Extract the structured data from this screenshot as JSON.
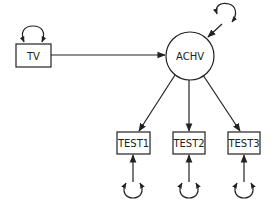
{
  "diagram": {
    "type": "path-diagram",
    "colors": {
      "stroke": "#222222",
      "background": "#ffffff"
    },
    "nodes": {
      "tv": {
        "label": "TV",
        "shape": "rectangle"
      },
      "achv": {
        "label": "ACHV",
        "shape": "circle"
      },
      "test1": {
        "label": "TEST1",
        "shape": "rectangle"
      },
      "test2": {
        "label": "TEST2",
        "shape": "rectangle"
      },
      "test3": {
        "label": "TEST3",
        "shape": "rectangle"
      }
    },
    "edges": [
      {
        "from": "TV",
        "to": "ACHV"
      },
      {
        "from": "ACHV",
        "to": "TEST1"
      },
      {
        "from": "ACHV",
        "to": "TEST2"
      },
      {
        "from": "ACHV",
        "to": "TEST3"
      },
      {
        "from": "disturbance",
        "to": "ACHV"
      },
      {
        "from": "error1",
        "to": "TEST1"
      },
      {
        "from": "error2",
        "to": "TEST2"
      },
      {
        "from": "error3",
        "to": "TEST3"
      }
    ],
    "variances": [
      "TV",
      "ACHV disturbance",
      "TEST1 error",
      "TEST2 error",
      "TEST3 error"
    ]
  }
}
